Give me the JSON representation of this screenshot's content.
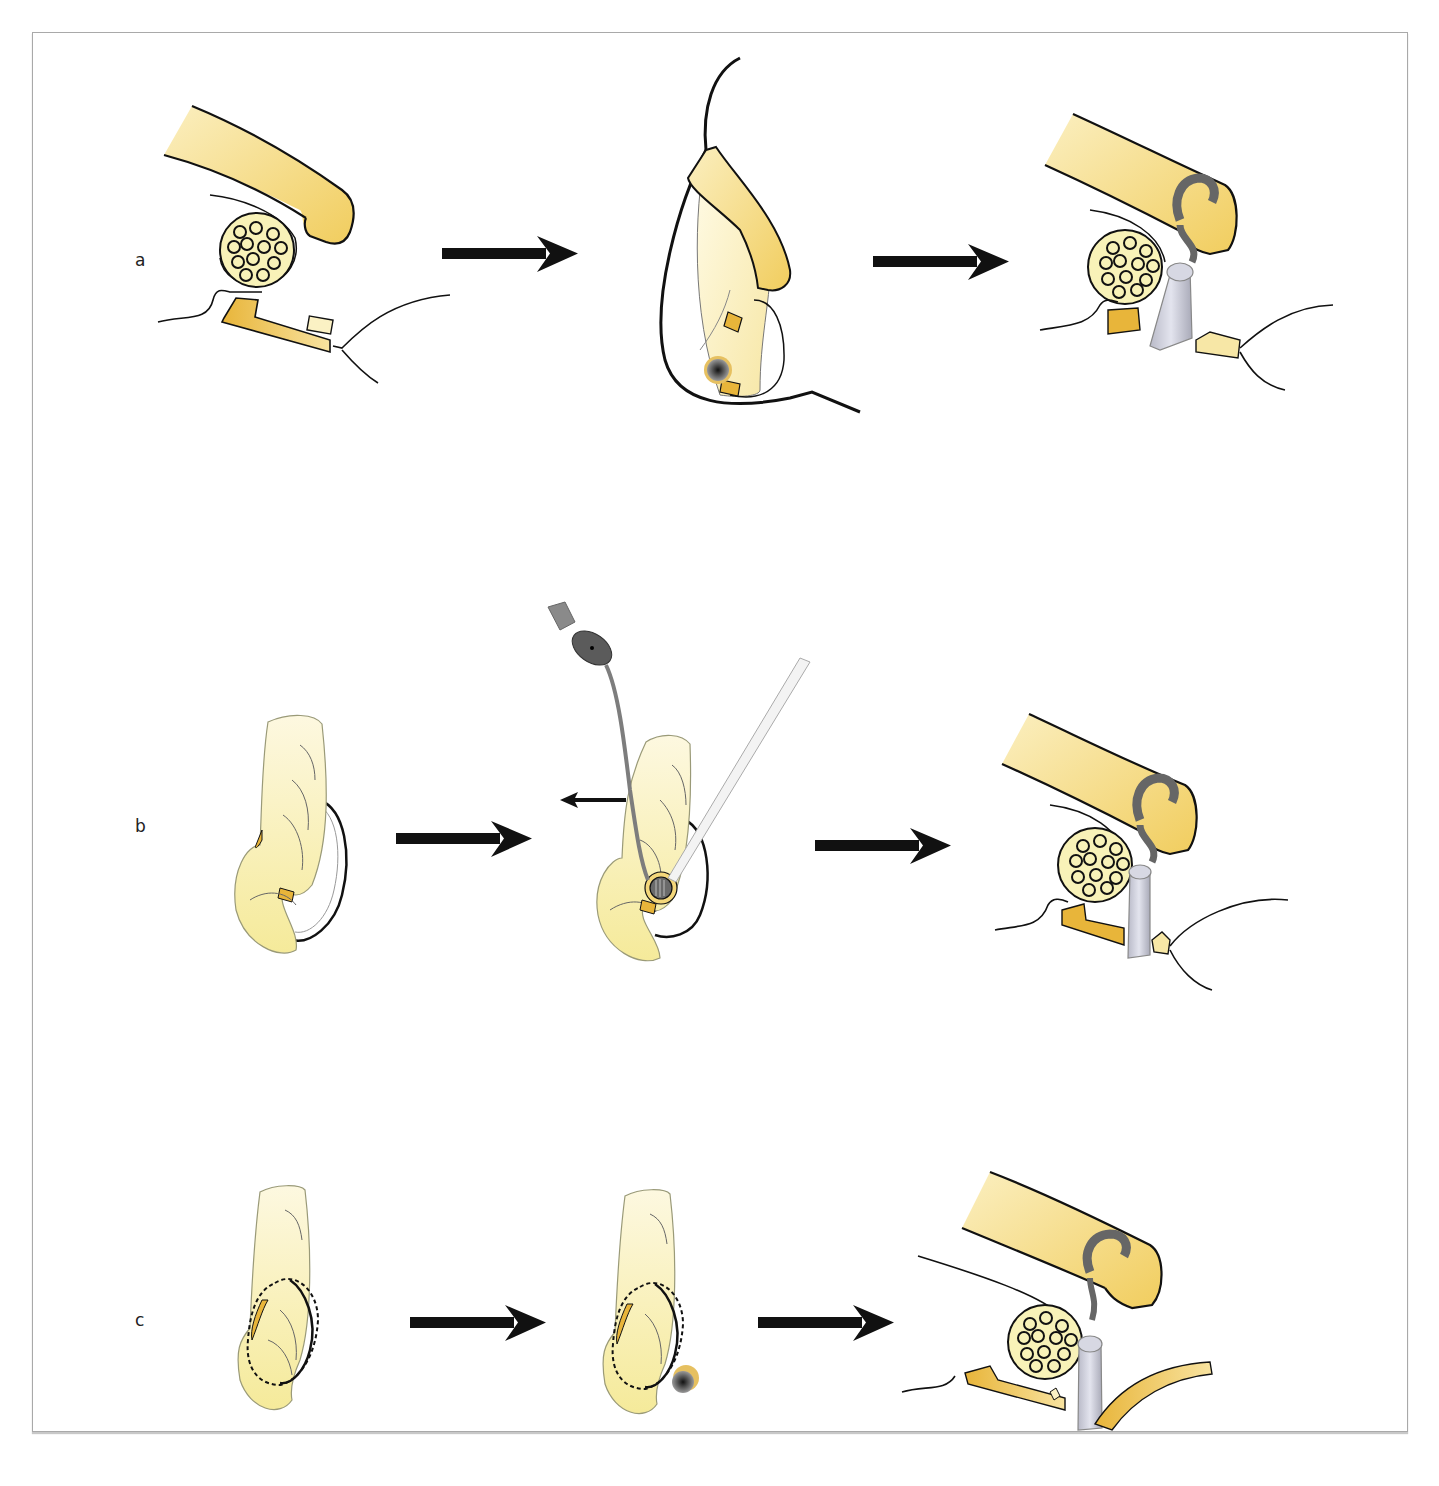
{
  "figure": {
    "rows": [
      {
        "label": "a",
        "steps": [
          {
            "name": "tongue-retracted-over-lens"
          },
          {
            "name": "lateral-view-insertion"
          },
          {
            "name": "ring-placed-with-probe"
          }
        ]
      },
      {
        "label": "b",
        "steps": [
          {
            "name": "curved-structure-with-loop"
          },
          {
            "name": "instruments-inserted",
            "direction_arrow": "left"
          },
          {
            "name": "ring-placed-with-probe"
          }
        ]
      },
      {
        "label": "c",
        "steps": [
          {
            "name": "dashed-outline-loop"
          },
          {
            "name": "dashed-outline-loop-with-knob"
          },
          {
            "name": "ring-placed-with-probe-and-curved-band"
          }
        ]
      }
    ],
    "colors": {
      "pale_yellow": "#fbf1c4",
      "mid_yellow": "#f4d77a",
      "deep_yellow": "#e8b53a",
      "gray_tool": "#7d7d7d",
      "light_gray_cylinder": "#cfd0dc",
      "outline": "#111111",
      "frame_border": "#a9a9a9"
    }
  }
}
